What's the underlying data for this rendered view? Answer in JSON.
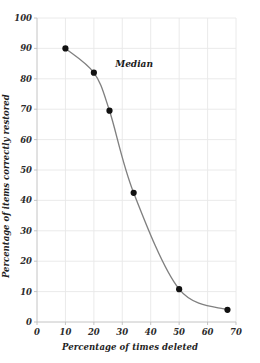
{
  "chart_data": {
    "type": "line",
    "title": "",
    "subtitle": "",
    "xlabel": "Percentage of times deleted",
    "ylabel": "Percentage of items correctly restored",
    "xlim": [
      0,
      70
    ],
    "ylim": [
      0,
      100
    ],
    "xticks": [
      0,
      10,
      20,
      30,
      40,
      50,
      60,
      70
    ],
    "yticks": [
      0,
      10,
      20,
      30,
      40,
      50,
      60,
      70,
      80,
      90,
      100
    ],
    "xtick_labels": [
      "0",
      "10",
      "20",
      "30",
      "40",
      "50",
      "60",
      "70"
    ],
    "ytick_labels": [
      "0",
      "10",
      "20",
      "30",
      "40",
      "50",
      "60",
      "70",
      "80",
      "90",
      "100"
    ],
    "grid": true,
    "legend": null,
    "series": [
      {
        "name": "Median",
        "marker": "filled-circle",
        "line_color": "#808080",
        "marker_color": "#111111",
        "x": [
          10,
          20,
          25.5,
          34,
          50,
          67
        ],
        "y": [
          90,
          82,
          69.5,
          42.5,
          10.8,
          4
        ]
      }
    ],
    "annotations": [
      {
        "text": "Median",
        "x": 27.5,
        "y": 84.5
      }
    ],
    "colors": {
      "line": "#808080",
      "marker": "#111111",
      "grid": "#e8e8e8",
      "axis": "#bdbdbd",
      "text": "#222222",
      "background": "#ffffff"
    }
  }
}
